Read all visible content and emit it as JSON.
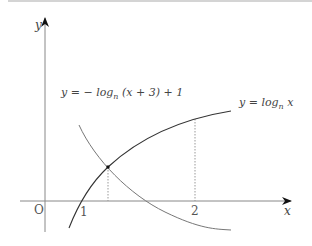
{
  "figure": {
    "axes": {
      "x_label": "x",
      "y_label": "y",
      "origin_label": "O",
      "x_ticks": [
        "1",
        "2"
      ]
    },
    "curves": [
      {
        "name": "log-curve",
        "label": "y = log",
        "subscript": "n",
        "suffix": " x",
        "color": "#333333"
      },
      {
        "name": "reflected-log-curve",
        "label": "y = − log",
        "subscript": "n",
        "suffix": " (x + 3) + 1",
        "color": "#777777"
      }
    ],
    "markers": {
      "intersection": "intersection point of the two curves",
      "guide_at_x2": "dotted vertical at x = 2"
    }
  }
}
